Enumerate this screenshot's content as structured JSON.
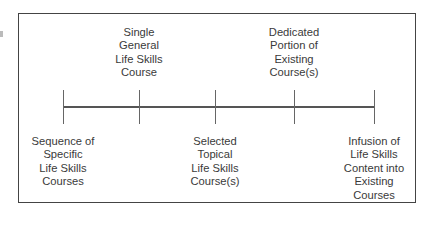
{
  "diagram": {
    "type": "continuum",
    "points": [
      {
        "position": "below",
        "lines": [
          "Sequence of",
          "Specific",
          "Life Skills",
          "Courses"
        ]
      },
      {
        "position": "above",
        "lines": [
          "Single",
          "General",
          "Life Skills",
          "Course"
        ]
      },
      {
        "position": "below",
        "lines": [
          "Selected",
          "Topical",
          "Life Skills",
          "Course(s)"
        ]
      },
      {
        "position": "above",
        "lines": [
          "Dedicated",
          "Portion of",
          "Existing",
          "Course(s)"
        ]
      },
      {
        "position": "below",
        "lines": [
          "Infusion of",
          "Life Skills",
          "Content into",
          "Existing",
          "Courses"
        ]
      }
    ],
    "colors": {
      "line": "#555555",
      "border": "#444444",
      "text": "#3a3a3a"
    }
  }
}
